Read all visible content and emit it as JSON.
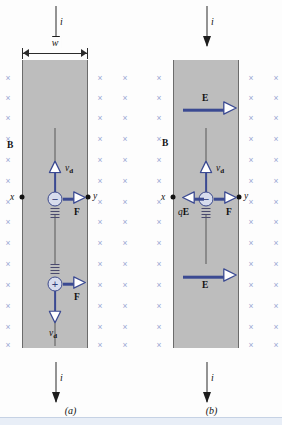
{
  "figure": {
    "background_color": "#fdfdfd",
    "strip_color": "#bdbdbd",
    "field_mark_color": "#9aa7d4",
    "vector_color": "#3b4a92"
  },
  "panels": [
    {
      "id": "a",
      "caption": "(a)",
      "width_label": "w",
      "field_label": "B",
      "field_symbol": "×",
      "current_label_top": "i",
      "current_label_bottom": "i",
      "terminal_left": "x",
      "terminal_right": "y",
      "carriers": [
        {
          "id": "negative",
          "sign": "−",
          "drift_label": "v",
          "drift_sub": "d",
          "drift_direction": "up",
          "force_label": "F",
          "force_direction": "right"
        },
        {
          "id": "positive",
          "sign": "+",
          "drift_label": "v",
          "drift_sub": "d",
          "drift_direction": "down",
          "force_label": "F",
          "force_direction": "right"
        }
      ]
    },
    {
      "id": "b",
      "caption": "(b)",
      "field_label": "B",
      "field_symbol": "×",
      "current_label_top": "i",
      "current_label_bottom": "i",
      "terminal_left": "x",
      "terminal_right": "y",
      "efield_label_top": "E",
      "efield_label_bottom": "E",
      "carriers": [
        {
          "id": "negative",
          "sign": "−",
          "drift_label": "v",
          "drift_sub": "d",
          "drift_direction": "up",
          "force_label": "F",
          "force_direction": "right",
          "electric_force_label_q": "q",
          "electric_force_label_E": "E",
          "electric_force_direction": "left"
        }
      ]
    }
  ]
}
